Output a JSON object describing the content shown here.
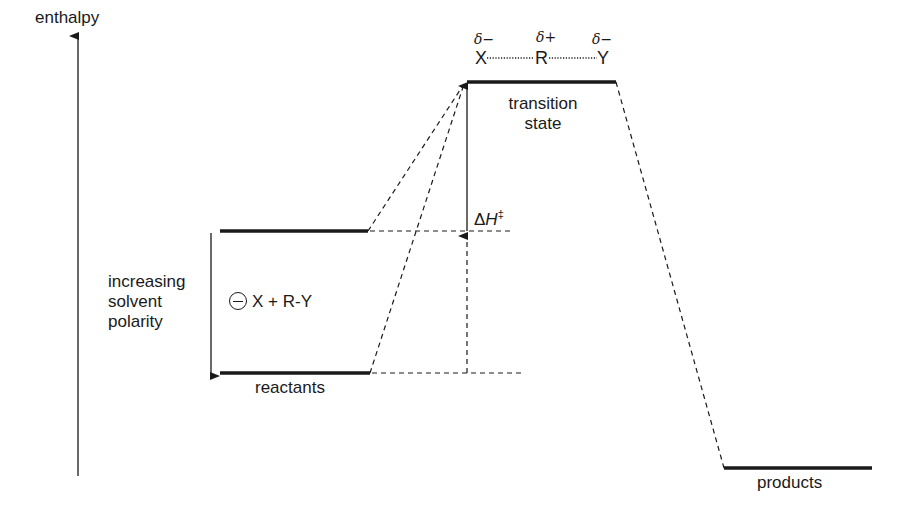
{
  "axis": {
    "label": "enthalpy"
  },
  "levels": {
    "transition_state": {
      "line1": "transition",
      "line2": "state"
    },
    "reactants": {
      "label": "reactants",
      "species": "X + R-Y"
    },
    "products": {
      "label": "products"
    }
  },
  "transition_structure": {
    "atoms": [
      "X",
      "R",
      "Y"
    ],
    "charges": [
      "δ−",
      "δ+",
      "δ−"
    ]
  },
  "solvent_effect": {
    "line1": "increasing",
    "line2": "solvent",
    "line3": "polarity"
  },
  "activation": {
    "symbol": "Δ",
    "var": "H",
    "dagger": "‡"
  },
  "colors": {
    "line": "#1a1a1a",
    "background": "#ffffff"
  }
}
